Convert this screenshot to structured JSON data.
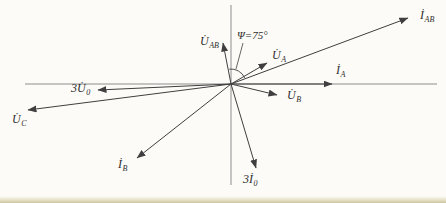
{
  "figure": {
    "background": "#fcfbf7",
    "axis_color": "#8d8d8d",
    "line_color": "#3f3f3f",
    "origin": {
      "x": 231,
      "y": 84
    },
    "axes": {
      "horizontal": {
        "x1": 25,
        "y1": 84,
        "x2": 437,
        "y2": 84
      },
      "vertical": {
        "x1": 231,
        "y1": 5,
        "x2": 231,
        "y2": 185
      }
    },
    "vectors": [
      {
        "id": "U_AB",
        "tip": [
          223,
          43
        ],
        "label": {
          "main": "U̇",
          "sub": "AB"
        },
        "label_pos": [
          200,
          35
        ]
      },
      {
        "id": "U_A",
        "tip": [
          267,
          63
        ],
        "label": {
          "main": "U̇",
          "sub": "A"
        },
        "label_pos": [
          272,
          49
        ]
      },
      {
        "id": "I_AB",
        "tip": [
          408,
          18
        ],
        "label": {
          "main": "İ",
          "sub": "AB"
        },
        "label_pos": [
          420,
          9
        ]
      },
      {
        "id": "I_A",
        "tip": [
          332,
          84
        ],
        "label": {
          "main": "İ",
          "sub": "A"
        },
        "label_pos": [
          336,
          64
        ]
      },
      {
        "id": "U_B",
        "tip": [
          277,
          95
        ],
        "label": {
          "main": "U̇",
          "sub": "B"
        },
        "label_pos": [
          287,
          89
        ]
      },
      {
        "id": "3U_0",
        "tip": [
          98,
          90
        ],
        "label": {
          "main": "3U̇",
          "sub": "0"
        },
        "label_pos": [
          71,
          82
        ]
      },
      {
        "id": "U_C",
        "tip": [
          28,
          110
        ],
        "label": {
          "main": "U̇",
          "sub": "C"
        },
        "label_pos": [
          12,
          113
        ]
      },
      {
        "id": "I_B",
        "tip": [
          137,
          158
        ],
        "label": {
          "main": "İ",
          "sub": "B"
        },
        "label_pos": [
          118,
          158
        ]
      },
      {
        "id": "3I_0",
        "tip": [
          256,
          168
        ],
        "label": {
          "main": "3İ",
          "sub": "0"
        },
        "label_pos": [
          243,
          173
        ]
      }
    ],
    "angle": {
      "text": "Ψ=75°",
      "label_pos": [
        237,
        29
      ],
      "leader": {
        "x1": 243,
        "y1": 43,
        "x2": 236,
        "y2": 69
      },
      "arc": {
        "r": 15,
        "start_deg": 97,
        "end_deg": 24
      }
    }
  }
}
